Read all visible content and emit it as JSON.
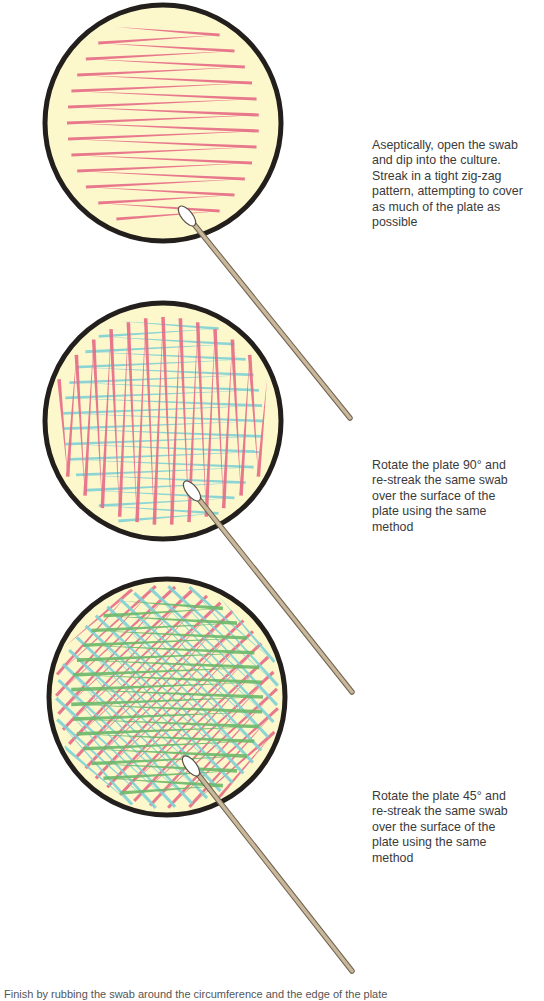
{
  "colors": {
    "background": "#ffffff",
    "plate_fill": "#fdf8cc",
    "plate_rim": "#231f1c",
    "streak_1": "#e66a86",
    "streak_2": "#7fd0d6",
    "streak_3": "#6cb86a",
    "swab_stick": "#c9b79a",
    "swab_stick_edge": "#6e6252",
    "swab_tip": "#ffffff",
    "text": "#3a3a3a"
  },
  "steps": [
    {
      "id": "step-1",
      "plate": {
        "cx": 163,
        "cy": 123,
        "r": 118
      },
      "swab": {
        "tip_x": 193,
        "tip_y": 223,
        "end_x": 350,
        "end_y": 418
      },
      "text_lines": [
        "Aseptically, open the swab",
        "and dip into the culture.",
        "Streak in a tight zig-zag",
        "pattern, attempting to cover",
        "as much of the plate as",
        "possible"
      ],
      "text_top": 138
    },
    {
      "id": "step-2",
      "plate": {
        "cx": 163,
        "cy": 421,
        "r": 118
      },
      "swab": {
        "tip_x": 198,
        "tip_y": 498,
        "end_x": 352,
        "end_y": 692
      },
      "text_lines": [
        "Rotate the plate 90° and",
        "re-streak the same swab",
        "over the surface of the",
        "plate using the same",
        "method"
      ],
      "text_top": 458
    },
    {
      "id": "step-3",
      "plate": {
        "cx": 167,
        "cy": 697,
        "r": 118
      },
      "swab": {
        "tip_x": 197,
        "tip_y": 773,
        "end_x": 352,
        "end_y": 971
      },
      "text_lines": [
        "Rotate the plate 45° and",
        "re-streak the same swab",
        "over the surface of the",
        "plate using the same",
        "method"
      ],
      "text_top": 789
    }
  ],
  "caption": "Finish by rubbing the swab around the circumference and the edge of the plate"
}
